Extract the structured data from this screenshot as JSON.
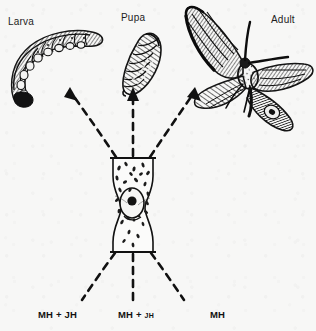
{
  "figure": {
    "background_color": "#f7f7f6",
    "ink_color": "#1a1a1a"
  },
  "stages": [
    {
      "id": "larva",
      "label": "Larva",
      "icon": "caterpillar-icon",
      "x": 8,
      "y": 16
    },
    {
      "id": "pupa",
      "label": "Pupa",
      "icon": "chrysalis-icon",
      "x": 121,
      "y": 12
    },
    {
      "id": "adult",
      "label": "Adult",
      "icon": "moth-icon",
      "x": 271,
      "y": 14
    }
  ],
  "gland": {
    "name": "endocrine-gland",
    "description": "secretory gland with nucleus and granules"
  },
  "hormone_labels": [
    {
      "id": "left",
      "main": "MH + ",
      "sub": "JH",
      "sub_small": false,
      "x": 68,
      "y": 313
    },
    {
      "id": "center",
      "main": "MH + ",
      "sub": "JH",
      "sub_small": true,
      "x": 148,
      "y": 313
    },
    {
      "id": "right",
      "main": "MH",
      "sub": "",
      "sub_small": false,
      "x": 230,
      "y": 313
    }
  ],
  "arrows": {
    "outgoing": [
      {
        "id": "to-larva",
        "target": "larva",
        "style": "dashed-curved-left"
      },
      {
        "id": "to-pupa",
        "target": "pupa",
        "style": "dashed-straight"
      },
      {
        "id": "to-adult",
        "target": "adult",
        "style": "dashed-curved-right"
      }
    ],
    "incoming": [
      {
        "id": "from-mh-jh-left",
        "source": "left"
      },
      {
        "id": "from-mh-jh-center",
        "source": "center"
      },
      {
        "id": "from-mh-right",
        "source": "right"
      }
    ]
  }
}
